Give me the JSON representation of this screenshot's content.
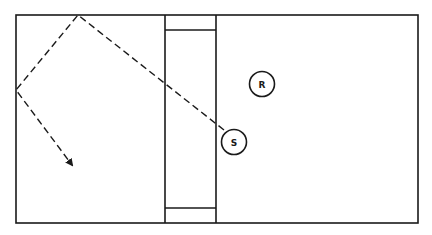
{
  "diagram": {
    "type": "court-diagram",
    "players": [
      {
        "id": "R",
        "label": "R",
        "cx": 262,
        "cy": 84
      },
      {
        "id": "S",
        "label": "S",
        "cx": 234,
        "cy": 142
      }
    ],
    "ball_path": {
      "style": "dashed",
      "points": [
        [
          224,
          130
        ],
        [
          78,
          15
        ],
        [
          16,
          90
        ],
        [
          72,
          165
        ]
      ],
      "ends_with_arrow": true
    },
    "colors": {
      "ink": "#1a1a1a",
      "background": "#ffffff"
    }
  }
}
